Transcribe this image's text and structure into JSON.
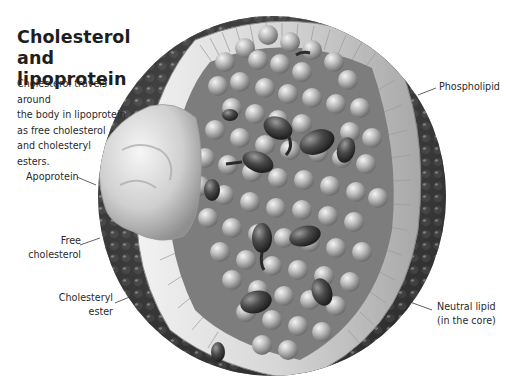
{
  "figure": {
    "title_line1": "Cholesterol and",
    "title_line2": "lipoprotein",
    "intro": {
      "line1": "Cholesterol travels around",
      "line2": "the body in lipoprotein",
      "line3": "as free cholesterol",
      "line4": "and cholesteryl",
      "line5": "esters."
    }
  },
  "labels": {
    "phospholipid": "Phospholipid",
    "apoprotein": "Apoprotein",
    "free_cholesterol_line1": "Free",
    "free_cholesterol_line2": "cholesterol",
    "cholesteryl_ester_line1": "Cholesteryl",
    "cholesteryl_ester_line2": "ester",
    "neutral_lipid_line1": "Neutral lipid",
    "neutral_lipid_line2": "(in the core)"
  },
  "colors": {
    "background": "#ffffff",
    "text": "#2a2a2a",
    "outer_shell": "#3a3a3a",
    "phospholipid_band": "#dcdcdc",
    "core_sphere": "#b8b8b8",
    "apoprotein": "#d9d9d9",
    "cholesterol_molecule": "#4a4a4a"
  }
}
